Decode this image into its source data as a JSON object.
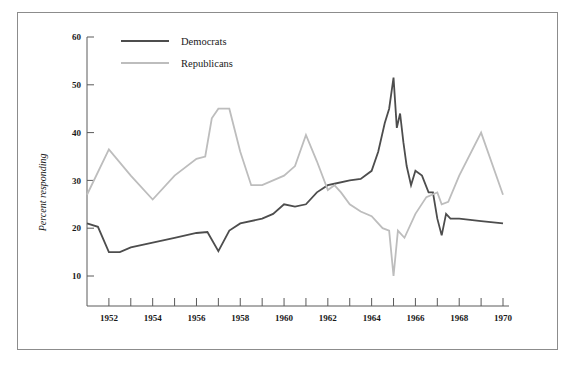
{
  "figure": {
    "border_color": "#8c8c8c",
    "background": "#ffffff"
  },
  "chart_data": {
    "type": "line",
    "title": "",
    "subtitle": "",
    "xlabel": "",
    "ylabel": "Percent responding",
    "xlim": [
      1951,
      1970
    ],
    "ylim": [
      5,
      60
    ],
    "yticks": [
      10,
      20,
      30,
      40,
      50,
      60
    ],
    "ytick_labels": [
      "10",
      "20",
      "30",
      "40",
      "50",
      "60"
    ],
    "xticks": [
      1951,
      1952,
      1953,
      1954,
      1955,
      1956,
      1957,
      1958,
      1959,
      1960,
      1961,
      1962,
      1963,
      1964,
      1965,
      1966,
      1967,
      1968,
      1969,
      1970
    ],
    "xtick_labels": [
      "1952",
      "1954",
      "1956",
      "1958",
      "1960",
      "1962",
      "1964",
      "1966",
      "1968",
      "1970"
    ],
    "labeled_xticks": [
      1952,
      1954,
      1956,
      1958,
      1960,
      1962,
      1964,
      1966,
      1968,
      1970
    ],
    "grid": false,
    "legend_position": "top-left",
    "series": [
      {
        "name": "Democrats",
        "color": "#4d4d4d",
        "linewidth": 1.8,
        "x": [
          1951.0,
          1951.5,
          1952.0,
          1952.5,
          1953.0,
          1954.0,
          1955.0,
          1956.0,
          1956.5,
          1957.0,
          1957.5,
          1958.0,
          1959.0,
          1959.5,
          1960.0,
          1960.5,
          1961.0,
          1961.5,
          1962.0,
          1962.3,
          1963.0,
          1963.5,
          1964.0,
          1964.3,
          1964.6,
          1964.8,
          1965.0,
          1965.15,
          1965.3,
          1965.45,
          1965.6,
          1965.8,
          1966.0,
          1966.3,
          1966.6,
          1966.8,
          1967.0,
          1967.2,
          1967.4,
          1967.6,
          1968.0,
          1969.0,
          1970.0
        ],
        "y": [
          21.0,
          20.3,
          15.0,
          15.0,
          16.0,
          17.0,
          18.0,
          19.0,
          19.2,
          15.2,
          19.5,
          21.0,
          22.0,
          23.0,
          25.0,
          24.5,
          25.0,
          27.5,
          29.0,
          29.3,
          30.0,
          30.3,
          32.0,
          36.0,
          42.0,
          45.0,
          51.5,
          41.0,
          44.0,
          38.0,
          33.0,
          29.0,
          32.0,
          31.0,
          27.5,
          27.5,
          22.0,
          18.5,
          23.0,
          22.0,
          22.0,
          21.5,
          21.0
        ]
      },
      {
        "name": "Republicans",
        "color": "#bdbdbd",
        "linewidth": 1.8,
        "x": [
          1951.0,
          1952.0,
          1953.0,
          1954.0,
          1955.0,
          1956.0,
          1956.4,
          1956.7,
          1957.0,
          1957.5,
          1958.0,
          1958.5,
          1959.0,
          1960.0,
          1960.5,
          1961.0,
          1961.5,
          1962.0,
          1962.3,
          1962.6,
          1963.0,
          1963.5,
          1964.0,
          1964.5,
          1964.8,
          1965.0,
          1965.2,
          1965.5,
          1966.0,
          1966.5,
          1967.0,
          1967.2,
          1967.5,
          1968.0,
          1969.0,
          1970.0
        ],
        "y": [
          27.0,
          36.5,
          31.0,
          26.0,
          31.0,
          34.5,
          35.0,
          43.0,
          45.0,
          45.0,
          36.0,
          29.0,
          29.0,
          31.0,
          33.0,
          39.5,
          34.0,
          28.0,
          29.0,
          27.5,
          25.0,
          23.5,
          22.5,
          20.0,
          19.5,
          10.0,
          19.5,
          18.0,
          23.0,
          26.5,
          27.5,
          25.0,
          25.5,
          31.0,
          40.0,
          27.0
        ]
      }
    ],
    "annotations": []
  },
  "legend": {
    "entries": [
      {
        "label": "Democrats",
        "color": "#4d4d4d"
      },
      {
        "label": "Republicans",
        "color": "#bdbdbd"
      }
    ]
  }
}
